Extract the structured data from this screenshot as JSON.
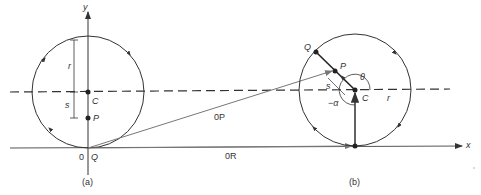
{
  "figure_a": {
    "caption": "(a)",
    "y_axis_label": "y",
    "origin_label": "0",
    "q_label": "Q",
    "c_label": "C",
    "p_label": "P",
    "r_label": "r",
    "s_label": "s"
  },
  "figure_b": {
    "caption": "(b)",
    "x_axis_label": "x",
    "q_label": "Q",
    "p_label": "P",
    "c_label": "C",
    "r_label": "r",
    "s_label": "s",
    "theta_label": "θ",
    "alpha_label": "−α"
  },
  "vectors": {
    "op_label": "0P",
    "or_label": "0R"
  },
  "colors": {
    "line": "#333333",
    "vector": "#777777"
  }
}
